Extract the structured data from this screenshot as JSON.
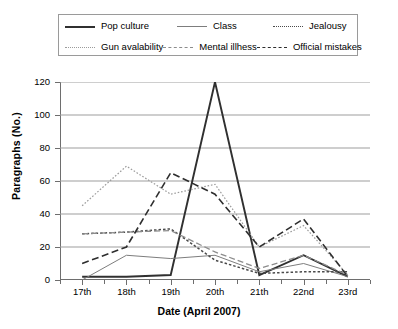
{
  "chart_data": {
    "type": "line",
    "title": "",
    "xlabel": "Date (April 2007)",
    "ylabel": "Paragraphs (No.)",
    "categories": [
      "17th",
      "18th",
      "19th",
      "20th",
      "21th",
      "22nd",
      "23rd"
    ],
    "ylim": [
      0,
      120
    ],
    "yticks": [
      0,
      20,
      40,
      60,
      80,
      100,
      120
    ],
    "grid": true,
    "legend_position": "top",
    "series": [
      {
        "name": "Pop culture",
        "values": [
          2,
          2,
          3,
          120,
          3,
          15,
          2
        ],
        "style": "solid-thick",
        "color": "#303030"
      },
      {
        "name": "Class",
        "values": [
          0,
          15,
          13,
          15,
          5,
          10,
          2
        ],
        "style": "solid-thin",
        "color": "#7d7d7d"
      },
      {
        "name": "Jealousy",
        "values": [
          28,
          29,
          31,
          12,
          4,
          5,
          5
        ],
        "style": "dotted",
        "color": "#4a4a4a"
      },
      {
        "name": "Gun avalability",
        "values": [
          45,
          69,
          52,
          58,
          20,
          33,
          3
        ],
        "style": "fine-dotted",
        "color": "#9b9b9b"
      },
      {
        "name": "Mental illhess",
        "values": [
          28,
          29,
          30,
          17,
          7,
          15,
          3
        ],
        "style": "dashed-gray",
        "color": "#8c8c8c"
      },
      {
        "name": "Official mistakes",
        "values": [
          10,
          20,
          65,
          52,
          20,
          37,
          2
        ],
        "style": "dashed-dark",
        "color": "#2e2e2e"
      }
    ]
  },
  "legend": {
    "rows": [
      [
        "Pop culture",
        "Class",
        "Jealousy"
      ],
      [
        "Gun avalability",
        "Mental illhess",
        "Official mistakes"
      ]
    ]
  }
}
